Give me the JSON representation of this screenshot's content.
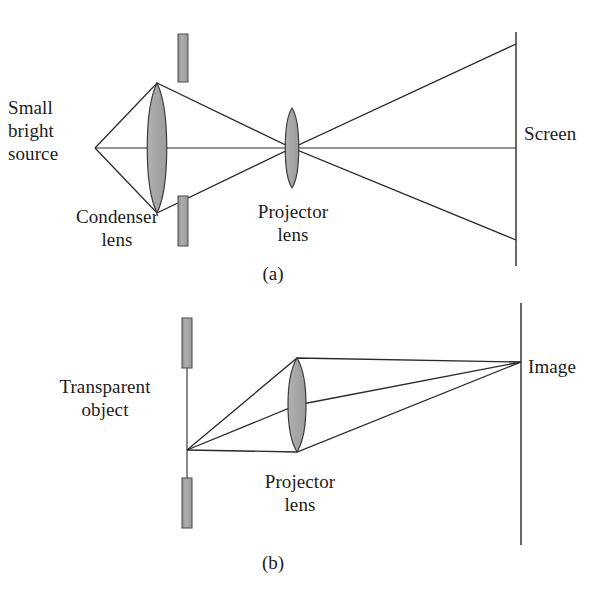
{
  "figure": {
    "background_color": "#ffffff",
    "ink_color": "#2a2a2a",
    "lens_fill_color": "#a8a8a8",
    "bar_fill_color": "#a0a0a0",
    "panels": [
      {
        "tag": "(a)",
        "tag_x": 273,
        "tag_y": 263,
        "description": "Small bright source imaged by condenser lens through slide aperture onto projector lens, then spreading to screen",
        "labels": [
          {
            "name": "source-label",
            "text": "Small\nbright\nsource",
            "x": 8,
            "y": 96,
            "align": "left"
          },
          {
            "name": "condenser-label",
            "text": "Condenser\nlens",
            "x": 58,
            "y": 205,
            "align": "center"
          },
          {
            "name": "projector-label",
            "text": "Projector\nlens",
            "x": 243,
            "y": 200,
            "align": "center"
          },
          {
            "name": "screen-label",
            "text": "Screen",
            "x": 524,
            "y": 122,
            "align": "left"
          }
        ]
      },
      {
        "tag": "(b)",
        "tag_x": 273,
        "tag_y": 552,
        "description": "Transparent object point emitting three rays through projector lens converging to image point on image plane",
        "labels": [
          {
            "name": "transparent-object-label",
            "text": "Transparent\nobject",
            "x": 40,
            "y": 375,
            "align": "center"
          },
          {
            "name": "projector-label-b",
            "text": "Projector\nlens",
            "x": 250,
            "y": 470,
            "align": "center"
          },
          {
            "name": "image-label",
            "text": "Image",
            "x": 528,
            "y": 355,
            "align": "left"
          }
        ]
      }
    ]
  },
  "geometry": {
    "panel_a": {
      "axis": {
        "x1": 95,
        "y1": 148,
        "x2": 516,
        "y2": 148
      },
      "source_point": {
        "x": 95,
        "y": 148
      },
      "condenser_lens": {
        "cx": 157,
        "cy": 148,
        "half_height": 65,
        "half_width": 12
      },
      "projector_lens": {
        "cx": 292,
        "cy": 148,
        "half_height": 40,
        "half_width": 9
      },
      "aperture_bars": [
        {
          "x": 178,
          "y": 34,
          "w": 10,
          "h": 48
        },
        {
          "x": 178,
          "y": 196,
          "w": 10,
          "h": 50
        }
      ],
      "screen_line": {
        "x": 516,
        "y1": 32,
        "y2": 266
      },
      "rays": [
        {
          "name": "upper-ray",
          "points": [
            [
              95,
              148
            ],
            [
              157,
              83
            ],
            [
              292,
              148
            ],
            [
              516,
              44
            ]
          ]
        },
        {
          "name": "lower-ray",
          "points": [
            [
              95,
              148
            ],
            [
              157,
              213
            ],
            [
              292,
              148
            ],
            [
              516,
              240
            ]
          ]
        }
      ]
    },
    "panel_b": {
      "object_plane": {
        "x": 187,
        "y1": 318,
        "y2": 528
      },
      "object_point": {
        "x": 187,
        "y": 450
      },
      "object_bars": [
        {
          "x": 182,
          "y": 318,
          "w": 10,
          "h": 50
        },
        {
          "x": 182,
          "y": 478,
          "w": 10,
          "h": 50
        }
      ],
      "projector_lens": {
        "cx": 297,
        "cy": 405,
        "half_height": 47,
        "half_width": 12
      },
      "image_plane": {
        "x": 521,
        "y1": 303,
        "y2": 545
      },
      "image_point": {
        "x": 521,
        "y": 362
      },
      "rays": [
        {
          "name": "upper-ray-b",
          "points": [
            [
              187,
              450
            ],
            [
              297,
              358
            ],
            [
              521,
              362
            ]
          ]
        },
        {
          "name": "middle-ray-b",
          "points": [
            [
              187,
              450
            ],
            [
              297,
              405
            ],
            [
              521,
              362
            ]
          ]
        },
        {
          "name": "lower-ray-b",
          "points": [
            [
              187,
              450
            ],
            [
              297,
              452
            ],
            [
              521,
              362
            ]
          ]
        }
      ]
    }
  }
}
